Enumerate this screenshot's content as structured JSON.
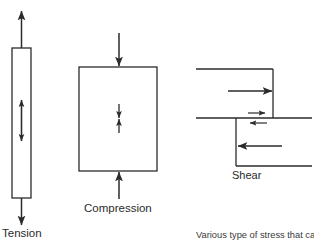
{
  "figure": {
    "caption": "Various type of stress that can be",
    "stroke_color": "#2b2b2b",
    "background_color": "#ffffff",
    "diagrams": [
      {
        "id": "tension",
        "label": "Tension",
        "description": "Vertical bar with arrows pulling outward at top and bottom and a double-headed arrow inside"
      },
      {
        "id": "compression",
        "label": "Compression",
        "description": "Rectangle with arrows pushing inward from top and bottom and a pair of opposing arrows inside"
      },
      {
        "id": "shear",
        "label": "Shear",
        "description": "Z-shaped offset element with opposing horizontal arrows above and below the shear plane"
      }
    ]
  }
}
